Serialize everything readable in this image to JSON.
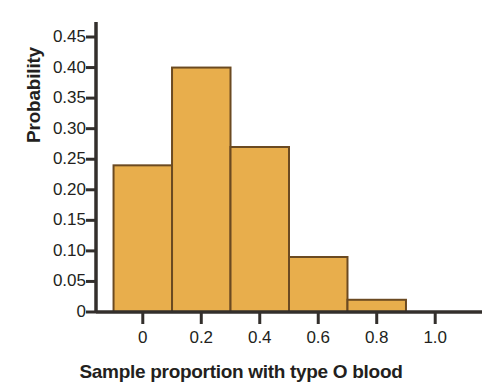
{
  "chart_data": {
    "type": "bar",
    "title": "",
    "xlabel": "Sample proportion with type O blood",
    "ylabel": "Probability",
    "categories": [
      "0",
      "0.2",
      "0.4",
      "0.6",
      "0.8"
    ],
    "bin_centers": [
      0,
      0.2,
      0.4,
      0.6,
      0.8
    ],
    "bin_edges": [
      -0.1,
      0.1,
      0.3,
      0.5,
      0.7,
      0.9
    ],
    "bin_width": 0.2,
    "values": [
      0.24,
      0.4,
      0.27,
      0.09,
      0.02
    ],
    "xlim": [
      -0.16,
      1.16
    ],
    "ylim": [
      0,
      0.45
    ],
    "x_ticks": [
      0,
      0.2,
      0.4,
      0.6,
      0.8,
      1.0
    ],
    "x_tick_labels": [
      "0",
      "0.2",
      "0.4",
      "0.6",
      "0.8",
      "1.0"
    ],
    "y_ticks": [
      0,
      0.05,
      0.1,
      0.15,
      0.2,
      0.25,
      0.3,
      0.35,
      0.4,
      0.45
    ],
    "y_tick_labels": [
      "0",
      "0.05",
      "0.10",
      "0.15",
      "0.20",
      "0.25",
      "0.30",
      "0.35",
      "0.40",
      "0.45"
    ],
    "grid": false,
    "legend": null,
    "colors": {
      "bar_fill": "#e8ae4c",
      "bar_stroke": "#6b4a21",
      "axis": "#332f2c",
      "text": "#231f20",
      "background": "#ffffff"
    }
  }
}
